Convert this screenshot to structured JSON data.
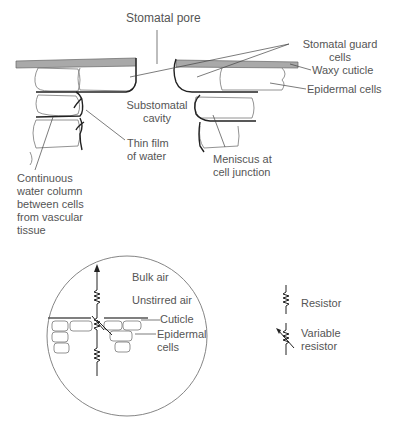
{
  "top_diagram": {
    "labels": {
      "stomatal_pore": "Stomatal pore",
      "guard_cells_1": "Stomatal guard",
      "guard_cells_2": "cells",
      "waxy_cuticle": "Waxy cuticle",
      "epidermal_cells": "Epidermal cells",
      "substomatal_1": "Substomatal",
      "substomatal_2": "cavity",
      "thin_film_1": "Thin film",
      "thin_film_2": "of water",
      "meniscus_1": "Meniscus at",
      "meniscus_2": "cell junction",
      "water_column_1": "Continuous",
      "water_column_2": "water column",
      "water_column_3": "between cells",
      "water_column_4": "from vascular",
      "water_column_5": "tissue"
    }
  },
  "inset_diagram": {
    "labels": {
      "bulk_air": "Bulk air",
      "unstirred_air": "Unstirred air",
      "cuticle": "Cuticle",
      "epidermal_1": "Epidermal",
      "epidermal_2": "cells"
    }
  },
  "legend": {
    "resistor": "Resistor",
    "variable_1": "Variable",
    "variable_2": "resistor"
  },
  "colors": {
    "cuticle_fill": "#a9a9a9",
    "line": "#222222",
    "text": "#555555"
  }
}
